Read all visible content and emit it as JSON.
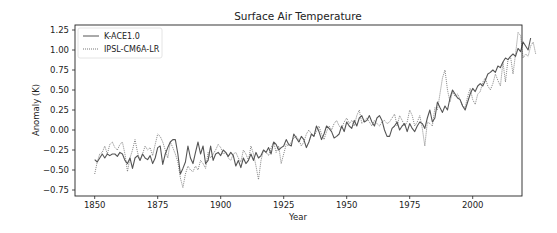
{
  "chart_data": {
    "type": "line",
    "title": "Surface Air Temperature",
    "xlabel": "Year",
    "ylabel": "Anomaly (K)",
    "xlim": [
      1843,
      2020
    ],
    "ylim": [
      -0.82,
      1.3
    ],
    "xticks": [
      1850,
      1875,
      1900,
      1925,
      1950,
      1975,
      2000
    ],
    "xtick_labels": [
      "1850",
      "1875",
      "1900",
      "1925",
      "1950",
      "1975",
      "2000"
    ],
    "yticks": [
      -0.75,
      -0.5,
      -0.25,
      0.0,
      0.25,
      0.5,
      0.75,
      1.0,
      1.25
    ],
    "ytick_labels": [
      "−0.75",
      "−0.50",
      "−0.25",
      "0.00",
      "0.25",
      "0.50",
      "0.75",
      "1.00",
      "1.25"
    ],
    "grid": false,
    "legend_position": "top-left",
    "x_start": 1850,
    "series": [
      {
        "name": "K-ACE1.0",
        "style": "solid",
        "color": "#555555",
        "values": [
          -0.37,
          -0.4,
          -0.35,
          -0.3,
          -0.35,
          -0.3,
          -0.32,
          -0.3,
          -0.3,
          -0.33,
          -0.28,
          -0.3,
          -0.38,
          -0.42,
          -0.35,
          -0.48,
          -0.35,
          -0.32,
          -0.38,
          -0.3,
          -0.35,
          -0.37,
          -0.32,
          -0.42,
          -0.35,
          -0.22,
          -0.2,
          -0.43,
          -0.3,
          -0.22,
          -0.15,
          -0.12,
          -0.12,
          -0.3,
          -0.55,
          -0.48,
          -0.4,
          -0.2,
          -0.35,
          -0.42,
          -0.28,
          -0.15,
          -0.3,
          -0.2,
          -0.42,
          -0.38,
          -0.2,
          -0.38,
          -0.3,
          -0.28,
          -0.32,
          -0.25,
          -0.28,
          -0.33,
          -0.28,
          -0.32,
          -0.45,
          -0.38,
          -0.47,
          -0.35,
          -0.42,
          -0.38,
          -0.3,
          -0.38,
          -0.28,
          -0.35,
          -0.32,
          -0.25,
          -0.28,
          -0.22,
          -0.3,
          -0.15,
          -0.18,
          -0.25,
          -0.22,
          -0.2,
          -0.12,
          -0.18,
          -0.2,
          -0.05,
          -0.1,
          -0.15,
          -0.08,
          -0.12,
          -0.22,
          -0.15,
          -0.05,
          -0.08,
          0.05,
          -0.02,
          -0.12,
          -0.05,
          0.05,
          0.02,
          -0.02,
          -0.1,
          -0.08,
          -0.05,
          0.05,
          -0.02,
          0.1,
          0.05,
          0.02,
          0.12,
          0.05,
          0.15,
          0.18,
          0.1,
          0.12,
          0.18,
          0.1,
          0.05,
          0.15,
          0.18,
          0.12,
          0.0,
          -0.08,
          -0.08,
          0.02,
          0.05,
          0.1,
          0.0,
          0.05,
          0.08,
          -0.02,
          0.08,
          0.02,
          -0.02,
          0.05,
          0.1,
          0.08,
          0.02,
          0.15,
          0.25,
          0.1,
          0.15,
          0.35,
          0.28,
          0.22,
          0.3,
          0.25,
          0.4,
          0.5,
          0.45,
          0.4,
          0.38,
          0.3,
          0.25,
          0.35,
          0.45,
          0.52,
          0.48,
          0.55,
          0.58,
          0.55,
          0.62,
          0.7,
          0.72,
          0.75,
          0.72,
          0.8,
          0.78,
          0.85,
          0.9,
          0.88,
          0.92,
          0.95,
          0.92,
          1.02,
          0.98,
          1.1,
          1.05,
          1.0,
          1.15
        ],
        "note_values_from": 1850
      },
      {
        "name": "IPSL-CM6A-LR",
        "style": "dotted",
        "color": "#777777",
        "values": [
          -0.55,
          -0.4,
          -0.3,
          -0.28,
          -0.2,
          -0.3,
          -0.18,
          -0.15,
          -0.22,
          -0.25,
          -0.18,
          -0.15,
          -0.3,
          -0.52,
          -0.35,
          -0.25,
          -0.12,
          -0.28,
          -0.38,
          -0.3,
          -0.2,
          -0.25,
          -0.22,
          -0.32,
          -0.18,
          -0.05,
          -0.08,
          -0.15,
          -0.25,
          -0.35,
          -0.15,
          -0.22,
          -0.3,
          -0.4,
          -0.6,
          -0.72,
          -0.55,
          -0.45,
          -0.5,
          -0.52,
          -0.45,
          -0.5,
          -0.38,
          -0.42,
          -0.48,
          -0.28,
          -0.35,
          -0.3,
          -0.25,
          -0.18,
          -0.22,
          -0.3,
          -0.28,
          -0.35,
          -0.38,
          -0.3,
          -0.28,
          -0.35,
          -0.4,
          -0.25,
          -0.3,
          -0.38,
          -0.2,
          -0.3,
          -0.45,
          -0.62,
          -0.38,
          -0.25,
          -0.28,
          -0.32,
          -0.22,
          -0.15,
          -0.28,
          -0.2,
          -0.42,
          -0.3,
          -0.18,
          -0.2,
          -0.15,
          -0.1,
          -0.08,
          -0.12,
          -0.2,
          -0.15,
          -0.05,
          0.0,
          -0.05,
          -0.08,
          -0.02,
          0.05,
          -0.05,
          -0.12,
          -0.02,
          0.05,
          0.0,
          0.08,
          0.12,
          0.05,
          0.02,
          0.1,
          0.15,
          0.08,
          0.12,
          0.05,
          0.18,
          0.25,
          0.08,
          0.12,
          0.15,
          0.1,
          0.05,
          0.12,
          0.08,
          0.05,
          0.1,
          0.12,
          0.08,
          0.1,
          0.15,
          0.2,
          0.05,
          0.18,
          0.12,
          0.05,
          0.1,
          0.25,
          0.18,
          0.05,
          0.1,
          0.18,
          0.02,
          -0.2,
          0.1,
          0.08,
          0.05,
          0.28,
          0.25,
          0.45,
          0.65,
          0.75,
          0.5,
          0.35,
          0.48,
          0.42,
          0.45,
          0.38,
          0.3,
          0.28,
          0.42,
          0.52,
          0.38,
          0.32,
          0.45,
          0.48,
          0.6,
          0.65,
          0.55,
          0.5,
          0.58,
          0.7,
          0.62,
          0.55,
          0.85,
          0.6,
          0.88,
          0.92,
          0.7,
          0.95,
          1.22,
          1.18,
          0.9,
          0.95,
          0.92,
          1.05,
          1.1,
          0.95
        ],
        "note_values_from": 1850
      }
    ]
  }
}
